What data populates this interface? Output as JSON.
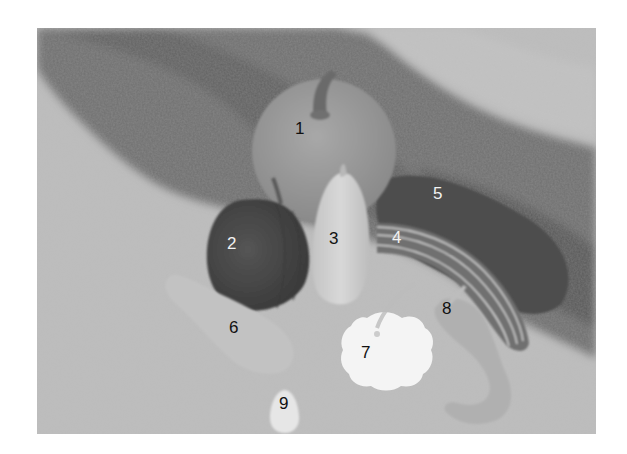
{
  "figure": {
    "labels": [
      {
        "id": "1",
        "name": "large round pumpkin",
        "x": 258,
        "y": 106,
        "color": "#111111"
      },
      {
        "id": "2",
        "name": "dark ribbed squash",
        "x": 196,
        "y": 221,
        "color": "#f2f2f2"
      },
      {
        "id": "3",
        "name": "pale elongated squash",
        "x": 298,
        "y": 216,
        "color": "#111111"
      },
      {
        "id": "4",
        "name": "striped long gourd",
        "x": 360,
        "y": 215,
        "color": "#f2f2f2"
      },
      {
        "id": "5",
        "name": "dark long squash",
        "x": 401,
        "y": 171,
        "color": "#f2f2f2"
      },
      {
        "id": "6",
        "name": "pale club-shaped squash",
        "x": 197,
        "y": 305,
        "color": "#111111"
      },
      {
        "id": "7",
        "name": "white scalloped pattypan squash",
        "x": 329,
        "y": 329,
        "color": "#111111"
      },
      {
        "id": "8",
        "name": "curved-neck gourd",
        "x": 410,
        "y": 286,
        "color": "#111111"
      },
      {
        "id": "9",
        "name": "small egg-shaped gourd",
        "x": 247,
        "y": 381,
        "color": "#111111"
      }
    ]
  },
  "colors": {
    "ground": "#b9b9b9",
    "grass": "#6e6e6e",
    "pumpkin": "#9a9a9a",
    "dark_squash": "#4a4a4a",
    "pale": "#cfcfcf",
    "white": "#f4f4f4"
  }
}
